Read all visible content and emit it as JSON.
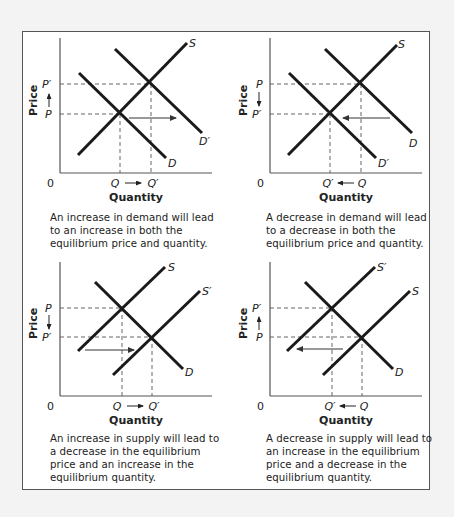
{
  "figure": {
    "border_color": "#555555",
    "background": "#ffffff",
    "curve_color": "#1a1a1a"
  },
  "panels": [
    {
      "id": "demand-increase",
      "y_axis_label": "Price",
      "x_axis_label": "Quantity",
      "origin_label": "0",
      "price_upper": "P′",
      "price_lower": "P",
      "price_arrow": "up",
      "qty_left": "Q",
      "qty_right": "Q′",
      "qty_arrow": "right",
      "curves": {
        "supply": [
          "S"
        ],
        "demand": [
          "D",
          "D′"
        ]
      },
      "caption": "An increase in demand will lead\nto an increase in both the\nequilibrium price and quantity."
    },
    {
      "id": "demand-decrease",
      "y_axis_label": "Price",
      "x_axis_label": "Quantity",
      "origin_label": "0",
      "price_upper": "P",
      "price_lower": "P′",
      "price_arrow": "down",
      "qty_left": "Q′",
      "qty_right": "Q",
      "qty_arrow": "left",
      "curves": {
        "supply": [
          "S"
        ],
        "demand": [
          "D",
          "D′"
        ]
      },
      "caption": "A decrease in demand will lead\nto a decrease in both the\nequilibrium price and quantity."
    },
    {
      "id": "supply-increase",
      "y_axis_label": "Price",
      "x_axis_label": "Quantity",
      "origin_label": "0",
      "price_upper": "P",
      "price_lower": "P′",
      "price_arrow": "down",
      "qty_left": "Q",
      "qty_right": "Q′",
      "qty_arrow": "right",
      "curves": {
        "supply": [
          "S",
          "S′"
        ],
        "demand": [
          "D"
        ]
      },
      "caption": "An increase in supply will lead to\na decrease in the equilibrium\nprice and an increase in the\nequilibrium quantity."
    },
    {
      "id": "supply-decrease",
      "y_axis_label": "Price",
      "x_axis_label": "Quantity",
      "origin_label": "0",
      "price_upper": "P′",
      "price_lower": "P",
      "price_arrow": "up",
      "qty_left": "Q′",
      "qty_right": "Q",
      "qty_arrow": "left",
      "curves": {
        "supply": [
          "S′",
          "S"
        ],
        "demand": [
          "D"
        ]
      },
      "caption": "A decrease in supply will lead to\nan increase in the equilibrium\nprice and a decrease in the\nequilibrium quantity."
    }
  ],
  "labels": {
    "S": "S",
    "S_prime": "S′",
    "D": "D",
    "D_prime": "D′"
  }
}
